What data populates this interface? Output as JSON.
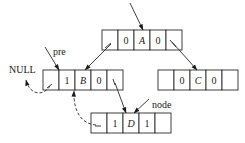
{
  "diagram": {
    "title": "",
    "nodes": [
      {
        "id": "A",
        "ltag": "0",
        "data": "A",
        "rtag": "0"
      },
      {
        "id": "B",
        "ltag": "1",
        "data": "B",
        "rtag": "0"
      },
      {
        "id": "C",
        "ltag": "0",
        "data": "C",
        "rtag": "0"
      },
      {
        "id": "D",
        "ltag": "1",
        "data": "D",
        "rtag": "1"
      }
    ],
    "labels": {
      "pre": "pre",
      "null": "NULL",
      "node": "node"
    },
    "edges": [
      {
        "from": "root",
        "to": "A",
        "style": "solid"
      },
      {
        "from": "A.lchild",
        "to": "B",
        "style": "solid"
      },
      {
        "from": "A.rchild",
        "to": "C",
        "style": "solid"
      },
      {
        "from": "B.rchild",
        "to": "D",
        "style": "solid"
      },
      {
        "from": "B.lchild",
        "to": "NULL",
        "style": "dashed"
      },
      {
        "from": "D.lchild",
        "to": "B",
        "style": "dashed"
      },
      {
        "from": "pre",
        "to": "B",
        "style": "solid"
      },
      {
        "from": "node",
        "to": "D",
        "style": "solid"
      }
    ]
  }
}
